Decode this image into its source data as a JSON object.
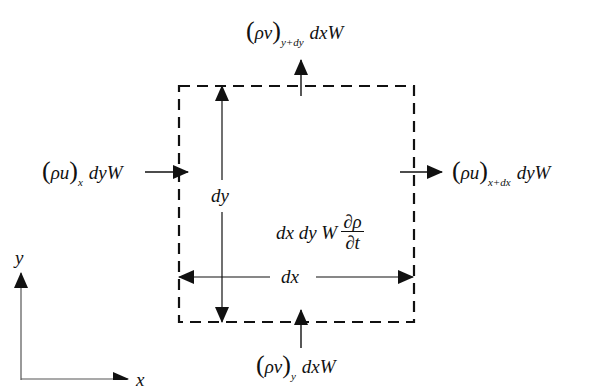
{
  "diagram": {
    "type": "control-volume-mass-balance",
    "colors": {
      "stroke": "#111111",
      "axis": "#555555",
      "background": "#ffffff"
    },
    "control_volume": {
      "border": "dashed",
      "left": 179,
      "top": 86,
      "right": 414,
      "bottom": 322
    },
    "labels": {
      "top_flux": {
        "rho": "ρ",
        "vel": "v",
        "subscript": "y+dy",
        "rest": "dxW"
      },
      "bottom_flux": {
        "rho": "ρ",
        "vel": "v",
        "subscript": "y",
        "rest": "dxW"
      },
      "left_flux": {
        "rho": "ρ",
        "vel": "u",
        "subscript": "x",
        "rest": "dyW"
      },
      "right_flux": {
        "rho": "ρ",
        "vel": "u",
        "subscript": "x+dx",
        "rest": "dyW"
      },
      "dy": "dy",
      "dx": "dx",
      "accumulation": {
        "prefix": "dx dy W",
        "numerator": "∂ρ",
        "denominator": "∂t"
      },
      "axis_x": "x",
      "axis_y": "y"
    }
  }
}
